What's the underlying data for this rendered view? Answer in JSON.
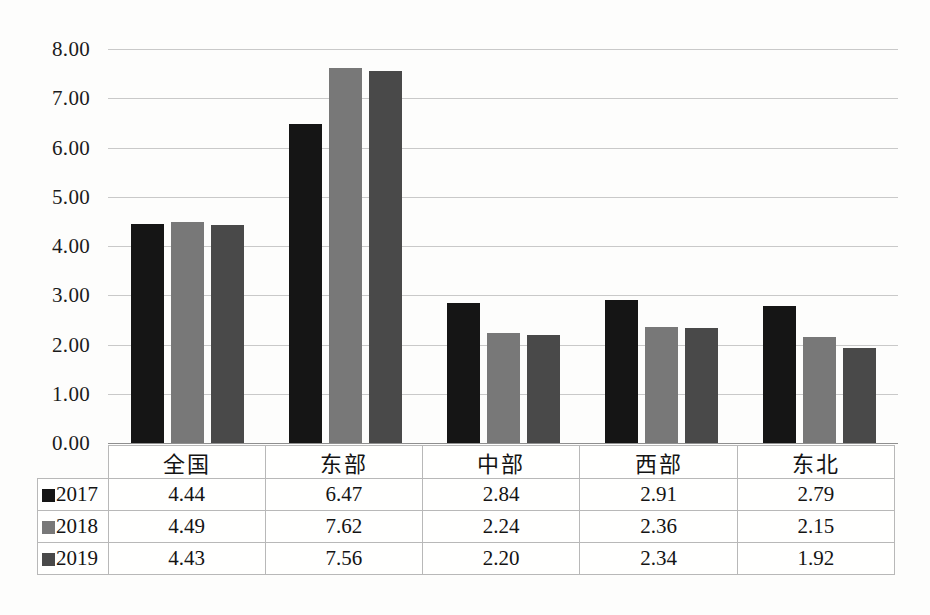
{
  "chart_data": {
    "type": "bar",
    "title": "",
    "xlabel": "",
    "ylabel": "",
    "ylim": [
      0,
      8
    ],
    "ytick_step": 1,
    "grid": true,
    "legend_position": "table-left",
    "categories": [
      "全国",
      "东部",
      "中部",
      "西部",
      "东北"
    ],
    "ytick_labels": [
      "8.00",
      "7.00",
      "6.00",
      "5.00",
      "4.00",
      "3.00",
      "2.00",
      "1.00",
      "0.00"
    ],
    "series": [
      {
        "name": "2017",
        "color": "#151515",
        "values": [
          4.44,
          6.47,
          2.84,
          2.91,
          2.79
        ]
      },
      {
        "name": "2018",
        "color": "#787878",
        "values": [
          4.49,
          7.62,
          2.24,
          2.36,
          2.15
        ]
      },
      {
        "name": "2019",
        "color": "#494949",
        "values": [
          4.43,
          7.56,
          2.2,
          2.34,
          1.92
        ]
      }
    ]
  },
  "table": {
    "corner_label": "",
    "column_headers": [
      "全国",
      "东部",
      "中部",
      "西部",
      "东北"
    ],
    "rows": [
      {
        "label": "2017",
        "color": "#151515",
        "cells": [
          "4.44",
          "6.47",
          "2.84",
          "2.91",
          "2.79"
        ]
      },
      {
        "label": "2018",
        "color": "#787878",
        "cells": [
          "4.49",
          "7.62",
          "2.24",
          "2.36",
          "2.15"
        ]
      },
      {
        "label": "2019",
        "color": "#494949",
        "cells": [
          "4.43",
          "7.56",
          "2.20",
          "2.34",
          "1.92"
        ]
      }
    ]
  }
}
